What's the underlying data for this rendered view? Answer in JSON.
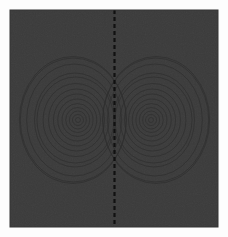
{
  "figure": {
    "title": "",
    "background_color": "#ffffff",
    "plot_background_color": "#3b3b3b",
    "plot_area": {
      "x": 10,
      "y": 10,
      "width": 208,
      "height": 217
    },
    "aria_label": "Contour plot of a symmetric two-lobe dipole field with a vertical dashed separatrix"
  },
  "divider": {
    "name": "separatrix",
    "orientation": "vertical",
    "x": 114.5,
    "y_start": 10,
    "y_end": 227,
    "color": "#111111",
    "style": "dashed",
    "dash_length": 4,
    "gap_length": 3,
    "line_width": 2.2
  },
  "chart_data": {
    "type": "contour",
    "title": "",
    "xlabel": "",
    "ylabel": "",
    "xlim": [
      -1.0,
      1.0
    ],
    "ylim": [
      -1.0,
      1.0
    ],
    "grid": false,
    "legend": false,
    "axes_visible": false,
    "tick_labels_x": [],
    "tick_labels_y": [],
    "colormap": "uniform-dark",
    "contour_line_color": "#2e2e2e",
    "contour_line_width": 0.7,
    "n_levels": 14,
    "annotations": [],
    "lobes": [
      {
        "name": "left-lobe",
        "center_x": 78,
        "center_y": 120,
        "n_rings": 14,
        "rings_rx": [
          2.5,
          5.5,
          8.5,
          12.0,
          15.5,
          19.5,
          23.5,
          28.0,
          33.0,
          38.5,
          40.5,
          47.5,
          53.0,
          53.5
        ],
        "rings_ry": [
          2.5,
          5.5,
          9.0,
          12.5,
          16.5,
          21.0,
          26.0,
          31.0,
          36.5,
          43.0,
          47.0,
          56.0,
          62.0,
          63.5
        ],
        "skew": -0.06
      },
      {
        "name": "right-lobe",
        "center_x": 151,
        "center_y": 120,
        "n_rings": 14,
        "rings_rx": [
          2.5,
          5.5,
          8.5,
          12.0,
          15.5,
          19.5,
          23.5,
          28.0,
          33.0,
          38.5,
          40.5,
          47.5,
          53.0,
          53.5
        ],
        "rings_ry": [
          2.5,
          5.5,
          9.0,
          12.5,
          16.5,
          21.0,
          26.0,
          31.0,
          36.5,
          43.0,
          47.0,
          56.0,
          62.0,
          63.5
        ],
        "skew": 0.06
      }
    ]
  }
}
